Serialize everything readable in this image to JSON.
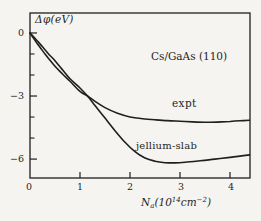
{
  "figure": {
    "background": "#f5f4f0",
    "ink": "#1f1f1f"
  },
  "chart_data": {
    "type": "line",
    "title": "",
    "annotation": "Cs/GaAs (110)",
    "ylabel": "Δφ(eV)",
    "xlabel": "Na(10¹⁴cm⁻²)",
    "xlabel_parts": {
      "base": "N",
      "sub": "a",
      "paren": "(10",
      "exp": "14",
      "unit": "cm",
      "unit_exp": "−2",
      "close": ")"
    },
    "xlim": [
      0,
      4.4
    ],
    "ylim": [
      -6.9,
      0.95
    ],
    "grid": false,
    "legend_position": "inline-labels",
    "x_ticks": [
      0,
      1,
      2,
      3,
      4
    ],
    "x_tick_labels": [
      "0",
      "1",
      "2",
      "3",
      "4"
    ],
    "y_ticks_major": [
      0,
      -3,
      -6
    ],
    "y_tick_labels": [
      "0",
      "−3",
      "−6"
    ],
    "y_ticks_minor": [
      -1,
      -2,
      -4,
      -5
    ],
    "series": [
      {
        "name": "expt",
        "points": [
          [
            0,
            0
          ],
          [
            0.1,
            -0.35
          ],
          [
            0.2,
            -0.68
          ],
          [
            0.3,
            -1.0
          ],
          [
            0.4,
            -1.3
          ],
          [
            0.5,
            -1.58
          ],
          [
            0.65,
            -1.95
          ],
          [
            0.8,
            -2.3
          ],
          [
            1.0,
            -2.78
          ],
          [
            1.15,
            -3.0
          ],
          [
            1.3,
            -3.25
          ],
          [
            1.5,
            -3.55
          ],
          [
            1.75,
            -3.82
          ],
          [
            2.0,
            -4.0
          ],
          [
            2.25,
            -4.08
          ],
          [
            2.5,
            -4.13
          ],
          [
            2.75,
            -4.17
          ],
          [
            3.0,
            -4.2
          ],
          [
            3.25,
            -4.23
          ],
          [
            3.5,
            -4.25
          ],
          [
            3.75,
            -4.24
          ],
          [
            4.0,
            -4.21
          ],
          [
            4.2,
            -4.18
          ],
          [
            4.39,
            -4.15
          ]
        ]
      },
      {
        "name": "jellium-slab",
        "points": [
          [
            0,
            0
          ],
          [
            0.1,
            -0.25
          ],
          [
            0.2,
            -0.52
          ],
          [
            0.3,
            -0.8
          ],
          [
            0.4,
            -1.07
          ],
          [
            0.5,
            -1.32
          ],
          [
            0.65,
            -1.75
          ],
          [
            0.8,
            -2.18
          ],
          [
            1.0,
            -2.62
          ],
          [
            1.15,
            -3.0
          ],
          [
            1.3,
            -3.45
          ],
          [
            1.5,
            -4.05
          ],
          [
            1.7,
            -4.65
          ],
          [
            1.9,
            -5.2
          ],
          [
            2.1,
            -5.65
          ],
          [
            2.3,
            -5.95
          ],
          [
            2.5,
            -6.1
          ],
          [
            2.7,
            -6.17
          ],
          [
            2.9,
            -6.18
          ],
          [
            3.1,
            -6.15
          ],
          [
            3.4,
            -6.08
          ],
          [
            3.7,
            -6.0
          ],
          [
            4.0,
            -5.92
          ],
          [
            4.2,
            -5.86
          ],
          [
            4.39,
            -5.8
          ]
        ]
      }
    ]
  }
}
